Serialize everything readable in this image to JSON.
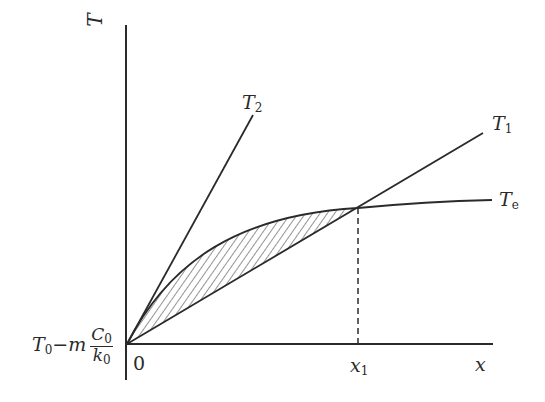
{
  "diagram": {
    "axes": {
      "y_label": "T",
      "x_label": "x",
      "origin_label": "0",
      "intercept_label": {
        "prefix": "T",
        "prefix_sub": "0",
        "minus": "−",
        "coef": "m",
        "num": "C",
        "num_sub": "0",
        "den": "k",
        "den_sub": "0"
      },
      "x_marker_label": "x",
      "x_marker_sub": "1"
    },
    "curves": [
      {
        "name": "T2",
        "label": "T",
        "sub": "2",
        "type": "line",
        "description": "steep straight line from origin"
      },
      {
        "name": "T1",
        "label": "T",
        "sub": "1",
        "type": "line",
        "description": "shallow straight line from origin"
      },
      {
        "name": "Te",
        "label": "T",
        "sub": "e",
        "type": "concave curve",
        "description": "equilibrium curve from origin, saturating"
      }
    ],
    "annotations": {
      "intersection": "T1 meets Te at x1",
      "shaded_region": "hatched area between Te and T1 from 0 to x1",
      "dashed_line": "vertical dashed line at x1"
    },
    "colors": {
      "line": "#2a2a2a",
      "background": "#ffffff"
    }
  }
}
